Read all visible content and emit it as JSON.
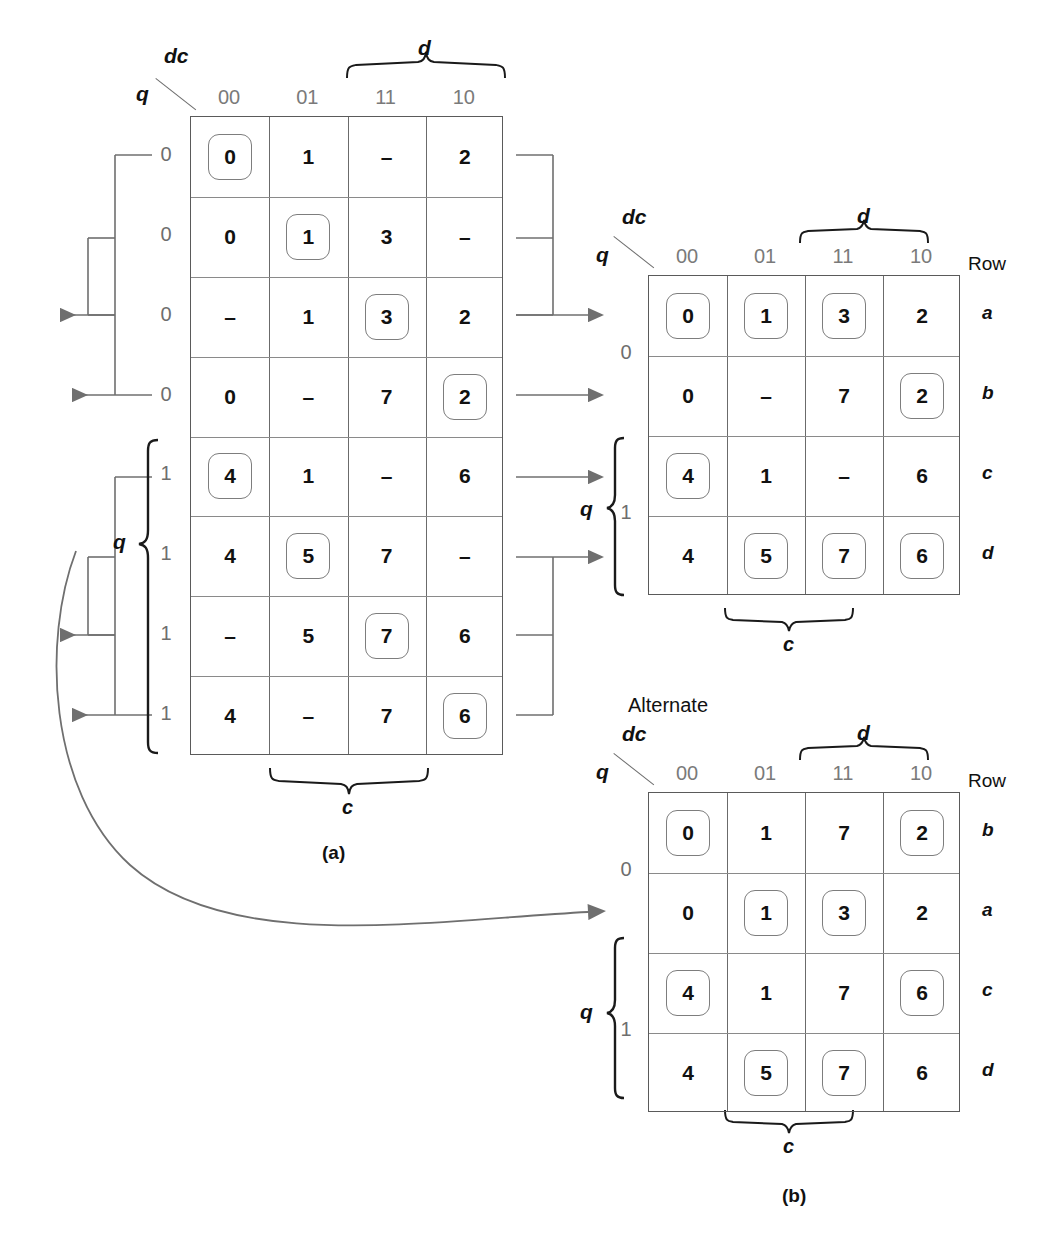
{
  "figure": {
    "label_a": "(a)",
    "label_b": "(b)",
    "alternate_label": "Alternate"
  },
  "axis": {
    "corner_top": "dc",
    "corner_left": "q",
    "col_headers": [
      "00",
      "01",
      "11",
      "10"
    ],
    "brace_d": "d",
    "brace_c": "c",
    "brace_q": "q",
    "row_header": "Row",
    "dash": "–"
  },
  "map_a": {
    "row_labels": [
      "0",
      "0",
      "0",
      "0",
      "1",
      "1",
      "1",
      "1"
    ],
    "rows": [
      [
        {
          "v": "0",
          "ring": true
        },
        {
          "v": "1",
          "ring": false
        },
        {
          "v": "–",
          "ring": false
        },
        {
          "v": "2",
          "ring": false
        }
      ],
      [
        {
          "v": "0",
          "ring": false
        },
        {
          "v": "1",
          "ring": true
        },
        {
          "v": "3",
          "ring": false
        },
        {
          "v": "–",
          "ring": false
        }
      ],
      [
        {
          "v": "–",
          "ring": false
        },
        {
          "v": "1",
          "ring": false
        },
        {
          "v": "3",
          "ring": true
        },
        {
          "v": "2",
          "ring": false
        }
      ],
      [
        {
          "v": "0",
          "ring": false
        },
        {
          "v": "–",
          "ring": false
        },
        {
          "v": "7",
          "ring": false
        },
        {
          "v": "2",
          "ring": true
        }
      ],
      [
        {
          "v": "4",
          "ring": true
        },
        {
          "v": "1",
          "ring": false
        },
        {
          "v": "–",
          "ring": false
        },
        {
          "v": "6",
          "ring": false
        }
      ],
      [
        {
          "v": "4",
          "ring": false
        },
        {
          "v": "5",
          "ring": true
        },
        {
          "v": "7",
          "ring": false
        },
        {
          "v": "–",
          "ring": false
        }
      ],
      [
        {
          "v": "–",
          "ring": false
        },
        {
          "v": "5",
          "ring": false
        },
        {
          "v": "7",
          "ring": true
        },
        {
          "v": "6",
          "ring": false
        }
      ],
      [
        {
          "v": "4",
          "ring": false
        },
        {
          "v": "–",
          "ring": false
        },
        {
          "v": "7",
          "ring": false
        },
        {
          "v": "6",
          "ring": true
        }
      ]
    ]
  },
  "map_b_top": {
    "row_names": [
      "a",
      "b",
      "c",
      "d"
    ],
    "q_values": [
      "0",
      "1"
    ],
    "rows": [
      [
        {
          "v": "0",
          "ring": true
        },
        {
          "v": "1",
          "ring": true
        },
        {
          "v": "3",
          "ring": true
        },
        {
          "v": "2",
          "ring": false
        }
      ],
      [
        {
          "v": "0",
          "ring": false
        },
        {
          "v": "–",
          "ring": false
        },
        {
          "v": "7",
          "ring": false
        },
        {
          "v": "2",
          "ring": true
        }
      ],
      [
        {
          "v": "4",
          "ring": true
        },
        {
          "v": "1",
          "ring": false
        },
        {
          "v": "–",
          "ring": false
        },
        {
          "v": "6",
          "ring": false
        }
      ],
      [
        {
          "v": "4",
          "ring": false
        },
        {
          "v": "5",
          "ring": true
        },
        {
          "v": "7",
          "ring": true
        },
        {
          "v": "6",
          "ring": true
        }
      ]
    ]
  },
  "map_b_alt": {
    "row_names": [
      "b",
      "a",
      "c",
      "d"
    ],
    "q_values": [
      "0",
      "1"
    ],
    "rows": [
      [
        {
          "v": "0",
          "ring": true
        },
        {
          "v": "1",
          "ring": false
        },
        {
          "v": "7",
          "ring": false
        },
        {
          "v": "2",
          "ring": true
        }
      ],
      [
        {
          "v": "0",
          "ring": false
        },
        {
          "v": "1",
          "ring": true
        },
        {
          "v": "3",
          "ring": true
        },
        {
          "v": "2",
          "ring": false
        }
      ],
      [
        {
          "v": "4",
          "ring": true
        },
        {
          "v": "1",
          "ring": false
        },
        {
          "v": "7",
          "ring": false
        },
        {
          "v": "6",
          "ring": true
        }
      ],
      [
        {
          "v": "4",
          "ring": false
        },
        {
          "v": "5",
          "ring": true
        },
        {
          "v": "7",
          "ring": true
        },
        {
          "v": "6",
          "ring": false
        }
      ]
    ]
  },
  "colors": {
    "ink": "#111111",
    "grid": "#6b6b6b",
    "muted": "#7a7a7a",
    "connector": "#6f6f6f"
  }
}
